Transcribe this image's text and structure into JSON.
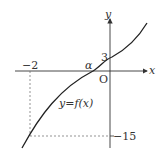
{
  "diagram": {
    "axes": {
      "x_label": "x",
      "y_label": "y",
      "origin_label": "O"
    },
    "curve_label": "y=f(x)",
    "points": {
      "x_neg": "−2",
      "root": "α",
      "y_intercept": "3",
      "y_neg": "−15"
    },
    "colors": {
      "curve": "#222222",
      "axes": "#333333",
      "dashed": "#666666"
    }
  }
}
